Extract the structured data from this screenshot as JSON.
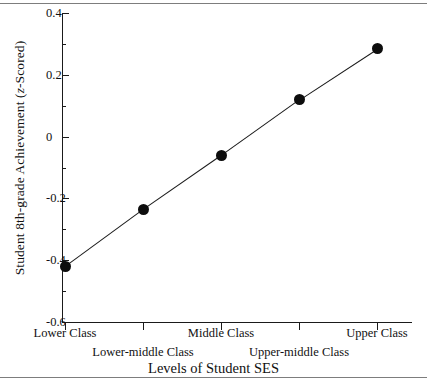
{
  "chart_data": {
    "type": "line",
    "title": "",
    "xlabel": "Levels of Student SES",
    "ylabel_prefix": "Student 8th-grade Achievement (",
    "ylabel_italic": "z",
    "ylabel_suffix": "-Scored)",
    "ylabel_full": "Student 8th-grade Achievement (z-Scored)",
    "categories": [
      "Lower Class",
      "Lower-middle Class",
      "Middle Class",
      "Upper-middle Class",
      "Upper Class"
    ],
    "values": [
      -0.42,
      -0.235,
      -0.06,
      0.12,
      0.285
    ],
    "ylim": [
      -0.6,
      0.4
    ],
    "yticks": [
      0.4,
      0.2,
      0,
      -0.2,
      -0.4,
      -0.6
    ],
    "ytick_labels": [
      "0.4",
      "0.2",
      "0",
      "-0.2",
      "-0.4",
      "-0.6"
    ],
    "yminor_ticks": [
      0.3,
      0.1,
      -0.1,
      -0.3,
      -0.5
    ],
    "grid": false,
    "legend": false,
    "marker": "filled-circle",
    "line_color": "#1a1a1a",
    "marker_color": "#0d0d0d",
    "background_color": "#ffffff",
    "label_rows": [
      0,
      1,
      0,
      1,
      0
    ]
  }
}
